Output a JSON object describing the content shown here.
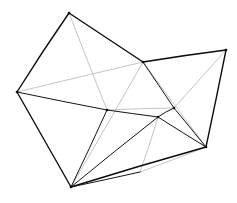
{
  "figure": {
    "background_color": "#ffffff",
    "stroke_color": "#141414",
    "faint_stroke_color": "#b9b9b9",
    "canvas": {
      "width": 237,
      "height": 203
    }
  },
  "geometry": {
    "vertices": [
      {
        "id": "apex-top",
        "label": "A",
        "x": 69,
        "y": 13
      },
      {
        "id": "left-outer",
        "label": "B",
        "x": 17,
        "y": 92
      },
      {
        "id": "bottom-outer",
        "label": "C",
        "x": 71,
        "y": 187
      },
      {
        "id": "mid-left-saddle",
        "label": "D",
        "x": 107,
        "y": 110
      },
      {
        "id": "mid-upper-joint",
        "label": "E",
        "x": 143,
        "y": 62
      },
      {
        "id": "right-outer-top",
        "label": "F",
        "x": 226,
        "y": 50
      },
      {
        "id": "right-outer-bottom",
        "label": "G",
        "x": 206,
        "y": 147
      },
      {
        "id": "mid-right-peak",
        "label": "H",
        "x": 158,
        "y": 117
      },
      {
        "id": "mid-right-node",
        "label": "I",
        "x": 174,
        "y": 108
      },
      {
        "id": "lower-mid-node",
        "label": "J",
        "x": 140,
        "y": 172
      }
    ],
    "edges_solid": [
      {
        "id": "edge-A-B",
        "from": "apex-top",
        "to": "left-outer"
      },
      {
        "id": "edge-A-E",
        "from": "apex-top",
        "to": "mid-upper-joint"
      },
      {
        "id": "edge-E-F",
        "from": "mid-upper-joint",
        "to": "right-outer-top"
      },
      {
        "id": "edge-F-G",
        "from": "right-outer-top",
        "to": "right-outer-bottom"
      },
      {
        "id": "edge-B-C",
        "from": "left-outer",
        "to": "bottom-outer"
      },
      {
        "id": "edge-B-D",
        "from": "left-outer",
        "to": "mid-left-saddle"
      },
      {
        "id": "edge-C-D",
        "from": "bottom-outer",
        "to": "mid-left-saddle"
      },
      {
        "id": "edge-C-H",
        "from": "bottom-outer",
        "to": "mid-right-peak"
      },
      {
        "id": "edge-C-G",
        "from": "bottom-outer",
        "to": "right-outer-bottom"
      },
      {
        "id": "edge-C-J",
        "from": "bottom-outer",
        "to": "lower-mid-node"
      },
      {
        "id": "edge-H-G",
        "from": "mid-right-peak",
        "to": "right-outer-bottom"
      },
      {
        "id": "edge-H-I",
        "from": "mid-right-peak",
        "to": "mid-right-node"
      },
      {
        "id": "edge-I-G",
        "from": "mid-right-node",
        "to": "right-outer-bottom"
      },
      {
        "id": "edge-E-I",
        "from": "mid-upper-joint",
        "to": "mid-right-node"
      },
      {
        "id": "edge-D-H",
        "from": "mid-left-saddle",
        "to": "mid-right-peak"
      }
    ],
    "edges_faint": [
      {
        "id": "faint-A-D",
        "from": "apex-top",
        "to": "mid-left-saddle"
      },
      {
        "id": "faint-B-E",
        "from": "left-outer",
        "to": "mid-upper-joint"
      },
      {
        "id": "faint-C-E",
        "from": "bottom-outer",
        "to": "mid-upper-joint"
      },
      {
        "id": "faint-D-I",
        "from": "mid-left-saddle",
        "to": "mid-right-node"
      },
      {
        "id": "faint-E-G",
        "from": "mid-upper-joint",
        "to": "right-outer-bottom"
      },
      {
        "id": "faint-F-I",
        "from": "right-outer-top",
        "to": "mid-right-node"
      },
      {
        "id": "faint-H-J",
        "from": "mid-right-peak",
        "to": "lower-mid-node"
      },
      {
        "id": "faint-J-G",
        "from": "lower-mid-node",
        "to": "right-outer-bottom"
      }
    ],
    "vertex_dots": [
      "apex-top",
      "left-outer",
      "bottom-outer",
      "mid-left-saddle",
      "mid-upper-joint",
      "right-outer-top",
      "right-outer-bottom",
      "mid-right-peak",
      "mid-right-node"
    ]
  }
}
